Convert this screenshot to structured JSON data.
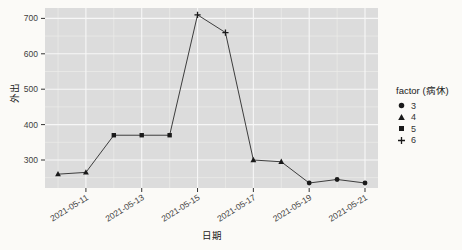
{
  "chart_data": {
    "type": "line",
    "title": "",
    "xlabel": "日期",
    "ylabel": "外出",
    "x": [
      "2021-05-10",
      "2021-05-11",
      "2021-05-12",
      "2021-05-13",
      "2021-05-14",
      "2021-05-15",
      "2021-05-16",
      "2021-05-17",
      "2021-05-18",
      "2021-05-19",
      "2021-05-20",
      "2021-05-21"
    ],
    "values": [
      260,
      265,
      370,
      370,
      370,
      710,
      660,
      300,
      295,
      235,
      245,
      235
    ],
    "point_factor_levels": [
      "4",
      "4",
      "5",
      "5",
      "5",
      "6",
      "6",
      "4",
      "4",
      "3",
      "3",
      "3"
    ],
    "x_tick_labels": [
      "2021-05-11",
      "2021-05-13",
      "2021-05-15",
      "2021-05-17",
      "2021-05-19",
      "2021-05-21"
    ],
    "x_tick_indices": [
      1,
      3,
      5,
      7,
      9,
      11
    ],
    "x_minor_indices": [
      0,
      2,
      4,
      6,
      8,
      10
    ],
    "y_ticks": [
      300,
      400,
      500,
      600,
      700
    ],
    "y_minor_ticks": [
      250,
      350,
      450,
      550,
      650
    ],
    "ylim": [
      220,
      730
    ],
    "grid": true,
    "legend": {
      "position": "right",
      "title": "factor (病休)",
      "items": [
        {
          "label": "3",
          "shape": "circle"
        },
        {
          "label": "4",
          "shape": "triangle"
        },
        {
          "label": "5",
          "shape": "square"
        },
        {
          "label": "6",
          "shape": "plus"
        }
      ]
    },
    "colors": {
      "panel_bg": "#dcdcdc",
      "grid_major": "#f7f7f7",
      "grid_minor": "#ededea",
      "line": "#2a2a2a",
      "point": "#1a1a1a",
      "tick": "#333333",
      "text": "#404040",
      "outer_bg": "#fbfaf7"
    }
  }
}
